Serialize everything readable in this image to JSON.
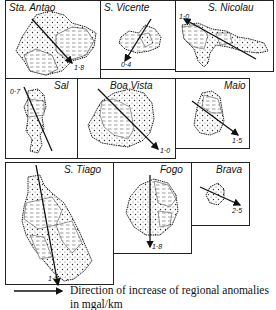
{
  "figure": {
    "islands": [
      {
        "name": "Sta. Antao",
        "value": "1·8"
      },
      {
        "name": "S. Vicente",
        "value": "0·4"
      },
      {
        "name": "S. Nicolau",
        "value": "1·0"
      },
      {
        "name": "Sal",
        "value": "0·7"
      },
      {
        "name": "Boa Vista",
        "value": "1·0"
      },
      {
        "name": "Maio",
        "value": "1·5"
      },
      {
        "name": "S. Tiago",
        "value": "1·0"
      },
      {
        "name": "Fogo",
        "value": "1·8"
      },
      {
        "name": "Brava",
        "value": "2·5"
      }
    ],
    "legend": {
      "line1": "Direction of increase of regional anomalies",
      "line2": "in mgal/km"
    },
    "colors": {
      "ink": "#111111",
      "background": "#ffffff"
    }
  }
}
